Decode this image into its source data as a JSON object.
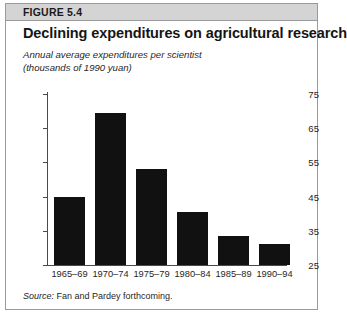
{
  "figure": {
    "header_label": "FIGURE 5.4",
    "title": "Declining expenditures on agricultural research",
    "subtitle_line1": "Annual average expenditures per scientist",
    "subtitle_line2": "(thousands of 1990 yuan)",
    "source_word": "Source:",
    "source_text": " Fan and Pardey forthcoming."
  },
  "chart_data": {
    "type": "bar",
    "title": "Declining expenditures on agricultural research",
    "subtitle": "Annual average expenditures per scientist (thousands of 1990 yuan)",
    "xlabel": "",
    "ylabel": "",
    "categories": [
      "1965–69",
      "1970–74",
      "1975–79",
      "1980–84",
      "1985–89",
      "1990–94"
    ],
    "values": [
      45,
      69.5,
      53,
      40.5,
      33.5,
      31
    ],
    "ylim": [
      25,
      75
    ],
    "yticks": [
      25,
      35,
      45,
      55,
      65,
      75
    ],
    "ytick_labels": [
      "25",
      "35",
      "45",
      "55",
      "65",
      "75"
    ],
    "grid": false,
    "legend": false,
    "bar_color": "#111111",
    "source": "Source: Fan and Pardey forthcoming."
  }
}
